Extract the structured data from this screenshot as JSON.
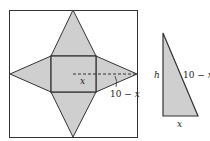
{
  "diagram": {
    "net": {
      "description": "Square sheet with pyramid net cut out: central square base with four isosceles triangles",
      "labels": {
        "x": "x",
        "slant": "10 − x"
      }
    },
    "triangle": {
      "labels": {
        "height": "h",
        "hypotenuse": "10 − x",
        "base": "x"
      }
    },
    "colors": {
      "fill": "#cfcfcf",
      "stroke": "#333333",
      "background": "#ffffff"
    }
  }
}
